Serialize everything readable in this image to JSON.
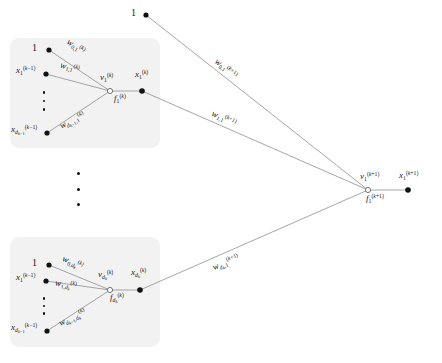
{
  "figure": {
    "type": "neural-network-layer-diagram",
    "background": "#ffffff",
    "box_fill": "#f2f2f2",
    "node_color": "#111111",
    "edge_color": "#8a8a8a",
    "width": 442,
    "height": 363
  },
  "bias_top": {
    "label": "1"
  },
  "unit_first": {
    "bias_label": "1",
    "input_first": "x₁⁽ᵏ⁻¹⁾",
    "input_last": "x_{d_{k-1}}^{(k-1)}",
    "weight_bias": "w_{0,1}^{(k)}",
    "weight_first": "w_{1,1}^{(k)}",
    "weight_last": "w_{d_{k-1},1}^{(k)}",
    "pre_activation": "v_1^{(k)}",
    "activation": "f_1^{(k)}",
    "output": "x_1^{(k)}"
  },
  "unit_last": {
    "bias_label": "1",
    "input_first": "x_1^{(k-1)}",
    "input_last": "x_{d_{k-1}}^{(k-1)}",
    "weight_bias": "w_{0,d_k}^{(k)}",
    "weight_first": "w_{1,d_k}^{(k)}",
    "weight_last": "w_{d_{k-1},d_k}^{(k)}",
    "pre_activation": "v_{d_k}^{(k)}",
    "activation": "f_{d_k}^{(k)}",
    "output": "x_{d_k}^{(k)}"
  },
  "next_layer": {
    "weight_bias": "w_{0,1}^{(k+1)}",
    "weight_first": "w_{1,1}^{(k+1)}",
    "weight_last": "w_{d_k,1}^{(k+1)}",
    "pre_activation": "v_1^{(k+1)}",
    "activation": "f_1^{(k+1)}",
    "output": "x_1^{(k+1)}"
  },
  "ellipsis": {
    "between_units": "vertical-dots",
    "inside_first_unit": "vertical-dots",
    "inside_last_unit": "vertical-dots"
  }
}
